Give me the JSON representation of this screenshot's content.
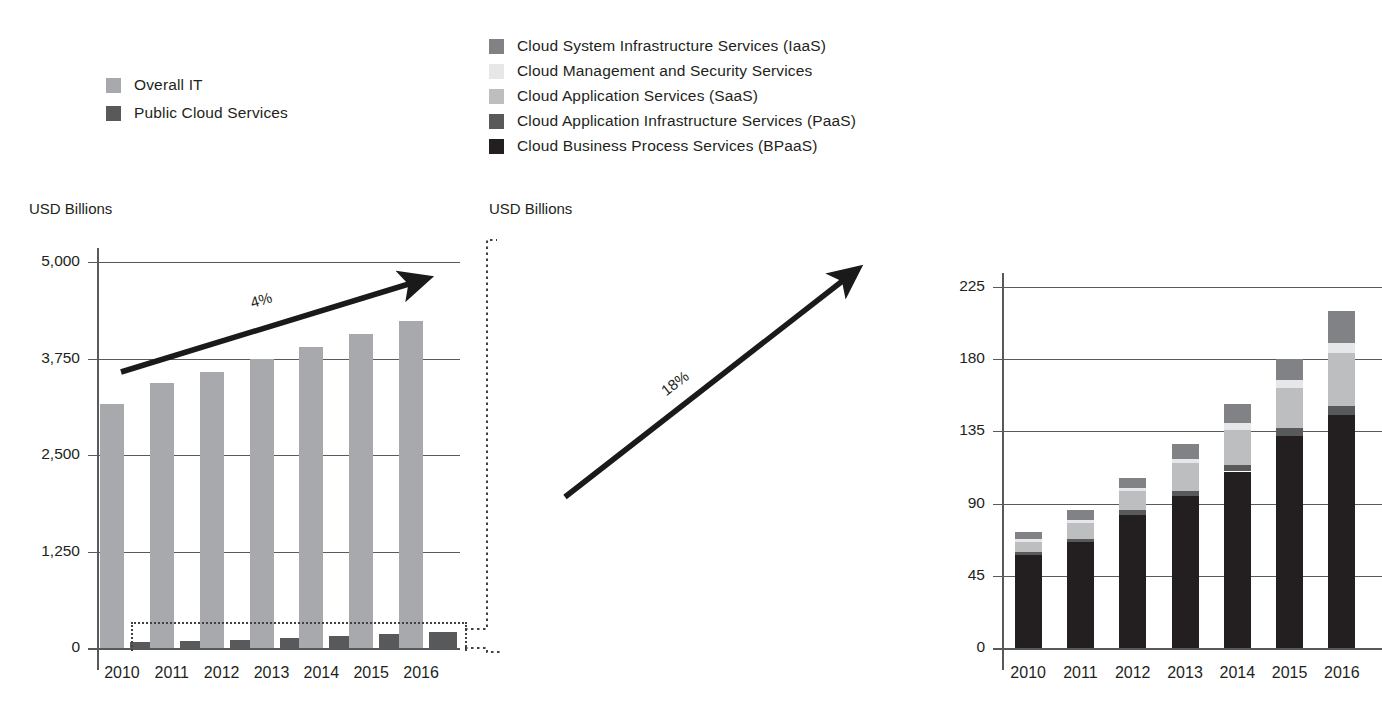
{
  "legend_left": {
    "items": [
      {
        "label": "Overall IT",
        "color": "#a7a9ac",
        "icon": "legend-swatch"
      },
      {
        "label": "Public Cloud Services",
        "color": "#58595b",
        "icon": "legend-swatch"
      }
    ]
  },
  "legend_right": {
    "items": [
      {
        "label": "Cloud System Infrastructure Services (IaaS)",
        "color": "#808285",
        "icon": "legend-swatch"
      },
      {
        "label": "Cloud Management and Security Services",
        "color": "#e6e7e8",
        "icon": "legend-swatch"
      },
      {
        "label": "Cloud Application Services (SaaS)",
        "color": "#bcbec0",
        "icon": "legend-swatch"
      },
      {
        "label": "Cloud Application Infrastructure Services (PaaS)",
        "color": "#58595b",
        "icon": "legend-swatch"
      },
      {
        "label": "Cloud Business Process Services (BPaaS)",
        "color": "#231f20",
        "icon": "legend-swatch"
      }
    ]
  },
  "left_caption": "USD Billions",
  "right_caption": "USD Billions",
  "annotations": {
    "left_growth": "4%",
    "right_growth": "18%"
  },
  "chart_data": [
    {
      "id": "overall-it-vs-public-cloud",
      "type": "bar",
      "title": "",
      "subtitle": "",
      "xlabel": "",
      "ylabel": "USD Billions",
      "categories": [
        "2010",
        "2011",
        "2012",
        "2013",
        "2014",
        "2015",
        "2016"
      ],
      "yticks": [
        "0",
        "1,250",
        "2,500",
        "3,750",
        "5,000"
      ],
      "ytick_values": [
        0,
        1250,
        2500,
        3750,
        5000
      ],
      "ylim": [
        0,
        5000
      ],
      "grid": true,
      "legend_position": "top-left",
      "annotation": "4%",
      "series": [
        {
          "name": "Overall IT",
          "color": "#a7a9ac",
          "values": [
            3160,
            3430,
            3580,
            3740,
            3900,
            4070,
            4240
          ]
        },
        {
          "name": "Public Cloud Services",
          "color": "#58595b",
          "values": [
            72,
            86,
            106,
            127,
            152,
            180,
            210
          ]
        }
      ]
    },
    {
      "id": "public-cloud-services-breakdown",
      "type": "bar",
      "stacked": true,
      "title": "",
      "subtitle": "",
      "xlabel": "",
      "ylabel": "USD Billions",
      "categories": [
        "2010",
        "2011",
        "2012",
        "2013",
        "2014",
        "2015",
        "2016"
      ],
      "yticks": [
        "0",
        "45",
        "90",
        "135",
        "180",
        "225"
      ],
      "ytick_values": [
        0,
        45,
        90,
        135,
        180,
        225
      ],
      "ylim": [
        0,
        250
      ],
      "grid": true,
      "legend_position": "top",
      "annotation": "18%",
      "series": [
        {
          "name": "Cloud Business Process Services (BPaaS)",
          "color": "#231f20",
          "values": [
            58,
            66,
            83,
            95,
            110,
            132,
            145
          ]
        },
        {
          "name": "Cloud Application Infrastructure Services (PaaS)",
          "color": "#58595b",
          "values": [
            2,
            2,
            3,
            3,
            4,
            5,
            6
          ]
        },
        {
          "name": "Cloud Application Services (SaaS)",
          "color": "#bcbec0",
          "values": [
            6,
            10,
            12,
            17,
            22,
            25,
            33
          ]
        },
        {
          "name": "Cloud Management and Security Services",
          "color": "#e6e7e8",
          "values": [
            2,
            2,
            2,
            3,
            4,
            5,
            6
          ]
        },
        {
          "name": "Cloud System Infrastructure Services (IaaS)",
          "color": "#808285",
          "values": [
            4,
            6,
            6,
            9,
            12,
            13,
            20
          ]
        }
      ],
      "totals": [
        72,
        86,
        106,
        127,
        152,
        180,
        210
      ]
    }
  ]
}
